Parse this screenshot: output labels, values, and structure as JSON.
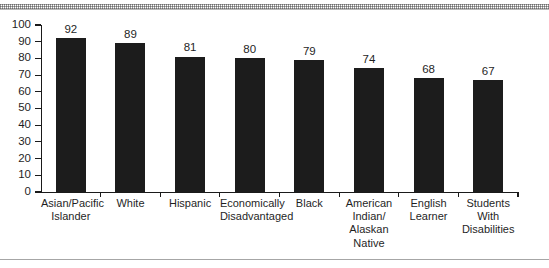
{
  "figure": {
    "background_color": "#ffffff",
    "bar_color": "#1c1c1c",
    "axis_color": "#1a1a1a",
    "rule_color": "#a6a6a6"
  },
  "chart_data": {
    "type": "bar",
    "title": "",
    "subtitle": "",
    "xlabel": "",
    "ylabel": "",
    "ylim": [
      0,
      100
    ],
    "yticks": [
      0,
      10,
      20,
      30,
      40,
      50,
      60,
      70,
      80,
      90,
      100
    ],
    "ytick_labels": [
      "0",
      "10",
      "20",
      "30",
      "40",
      "50",
      "60",
      "70",
      "80",
      "90",
      "100"
    ],
    "grid": false,
    "legend": false,
    "legend_position": "none",
    "value_labels": true,
    "categories": [
      "Asian/Pacific Islander",
      "White",
      "Hispanic",
      "Economically Disadvantaged",
      "Black",
      "American Indian/ Alaskan Native",
      "English Learner",
      "Students With Disabilities"
    ],
    "category_lines": [
      [
        "Asian/Pacific",
        "Islander"
      ],
      [
        "White"
      ],
      [
        "Hispanic"
      ],
      [
        "Economically",
        "Disadvantaged"
      ],
      [
        "Black"
      ],
      [
        "American",
        "Indian/",
        "Alaskan",
        "Native"
      ],
      [
        "English",
        "Learner"
      ],
      [
        "Students",
        "With",
        "Disabilities"
      ]
    ],
    "values": [
      92,
      89,
      81,
      80,
      79,
      74,
      68,
      67
    ],
    "value_label_text": [
      "92",
      "89",
      "81",
      "80",
      "79",
      "74",
      "68",
      "67"
    ]
  }
}
